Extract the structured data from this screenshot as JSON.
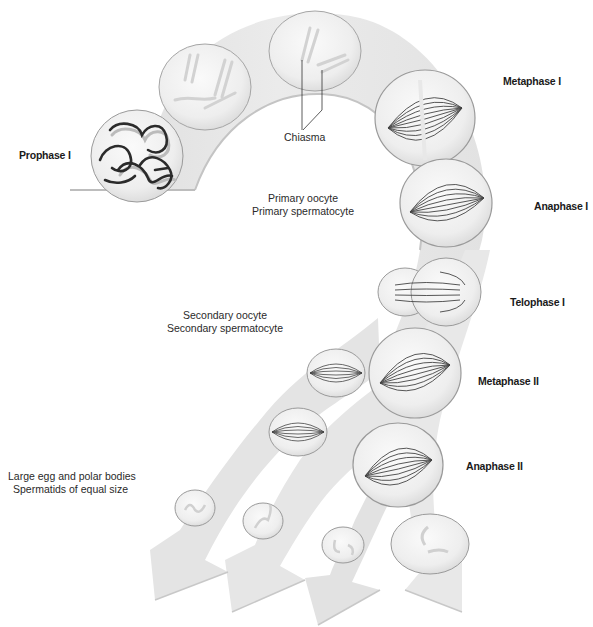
{
  "phases": {
    "prophase_1": "Prophase I",
    "metaphase_1": "Metaphase I",
    "anaphase_1": "Anaphase I",
    "telophase_1": "Telophase I",
    "metaphase_2": "Metaphase II",
    "anaphase_2": "Anaphase II"
  },
  "annotations": {
    "chiasma": "Chiasma"
  },
  "cell_stages": {
    "primary": [
      "Primary oocyte",
      "Primary spermatocyte"
    ],
    "secondary": [
      "Secondary oocyte",
      "Secondary spermatocyte"
    ],
    "products": [
      "Large egg and polar bodies",
      "Spermatids of equal size"
    ]
  },
  "colors": {
    "band_fill": "#e6e6e6",
    "band_edge": "#c8c8c8",
    "cell_fill": "#f2f2f2",
    "cell_stroke": "#9a9a9a",
    "chromosome_dark": "#2b2b2b",
    "spindle": "#444444",
    "text": "#1a1a1a"
  }
}
